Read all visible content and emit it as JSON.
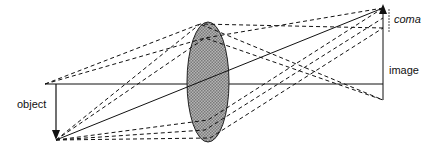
{
  "labels": {
    "object": "object",
    "image": "image",
    "coma": "coma"
  },
  "colors": {
    "line": "#111111",
    "lens_fill": "#9a9a9a"
  }
}
